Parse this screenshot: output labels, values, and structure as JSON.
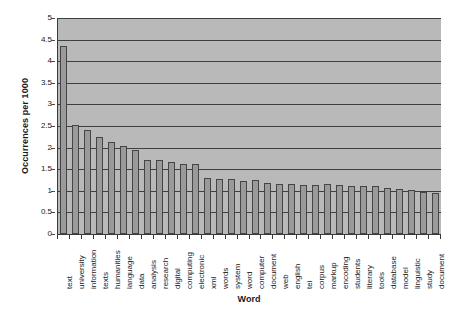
{
  "chart_data": {
    "type": "bar",
    "title": "",
    "xlabel": "Word",
    "ylabel": "Occurrences per 1000",
    "ylim": [
      0,
      5
    ],
    "ytick_step": 0.5,
    "yticks": [
      "0",
      "0.5",
      "1",
      "1.5",
      "2",
      "2.5",
      "3",
      "3.5",
      "4",
      "4.5",
      "5"
    ],
    "grid": true,
    "legend": false,
    "plot_background": "#b9b9b9",
    "bar_fill": "#9a9a9a",
    "bar_border": "#454545",
    "categories": [
      "text",
      "university",
      "information",
      "texts",
      "humanities",
      "language",
      "data",
      "analysis",
      "research",
      "digital",
      "computing",
      "electronic",
      "xml",
      "words",
      "system",
      "word",
      "computer",
      "document",
      "web",
      "english",
      "tei",
      "corpus",
      "markup",
      "encoding",
      "students",
      "literary",
      "tools",
      "database",
      "model",
      "linguistic",
      "study",
      "document"
    ],
    "values": [
      4.35,
      2.53,
      2.41,
      2.25,
      2.13,
      2.04,
      1.95,
      1.72,
      1.72,
      1.66,
      1.63,
      1.62,
      1.29,
      1.28,
      1.27,
      1.23,
      1.24,
      1.17,
      1.16,
      1.15,
      1.14,
      1.14,
      1.15,
      1.13,
      1.12,
      1.1,
      1.1,
      1.06,
      1.04,
      1.02,
      0.97,
      0.95
    ]
  }
}
